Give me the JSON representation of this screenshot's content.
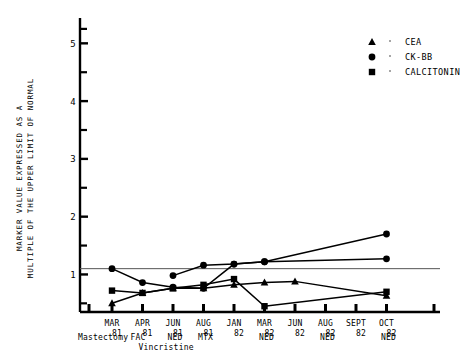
{
  "chart_data": {
    "type": "line",
    "title": "",
    "xlabel": "",
    "ylabel": "MARKER VALUE EXPRESSED AS A MULTIPLE OF THE UPPER LIMIT OF NORMAL",
    "ylabel_line1": "MARKER VALUE EXPRESSED AS A",
    "ylabel_line2": "MULTIPLE OF THE UPPER LIMIT OF NORMAL",
    "ylim": [
      0.35,
      5.3
    ],
    "yticks_major": [
      1,
      2,
      3,
      4,
      5
    ],
    "ytick_labels": [
      "1",
      "2",
      "3",
      "4",
      "5"
    ],
    "yticks_minor": [
      0.5,
      1.5,
      2.5,
      3.5,
      4.5,
      5.25
    ],
    "grid": false,
    "reference_line": {
      "value": 1.1,
      "label": ""
    },
    "legend_position": "top-right",
    "categories": [
      "MAR 81",
      "APR 81",
      "JUN 81",
      "AUG 81",
      "JAN 82",
      "MAR 82",
      "JUN 82",
      "AUG 82",
      "SEPT 82",
      "OCT 82"
    ],
    "category_months": [
      "MAR",
      "APR",
      "JUN",
      "AUG",
      "JAN",
      "MAR",
      "JUN",
      "AUG",
      "SEPT",
      "OCT"
    ],
    "category_years": [
      "81",
      "81",
      "81",
      "81",
      "82",
      "82",
      "82",
      "82",
      "82",
      "82"
    ],
    "series": [
      {
        "name": "CEA",
        "marker": "triangle",
        "x": [
          "MAR 81",
          "APR 81",
          "JUN 81",
          "AUG 81",
          "JAN 82",
          "MAR 82",
          "JUN 82",
          "OCT 82"
        ],
        "values": [
          0.5,
          0.68,
          0.76,
          0.76,
          0.82,
          0.86,
          0.88,
          0.63
        ]
      },
      {
        "name": "CK-BB",
        "marker": "circle",
        "x": [
          "MAR 81",
          "APR 81",
          "JUN 81",
          "AUG 81",
          "JAN 82",
          "MAR 82",
          "OCT 82"
        ],
        "values": [
          1.1,
          0.86,
          0.78,
          0.76,
          1.18,
          1.22,
          1.27
        ]
      },
      {
        "name": "CALCITONIN",
        "marker": "square",
        "x": [
          "MAR 81",
          "APR 81",
          "JUN 81",
          "AUG 81",
          "JAN 82",
          "MAR 82",
          "OCT 82"
        ],
        "values": [
          0.72,
          0.68,
          0.76,
          0.82,
          0.92,
          0.45,
          0.7
        ]
      },
      {
        "name": "CK-BB-upper",
        "marker": "circle",
        "x": [
          "JUN 81",
          "AUG 81",
          "JAN 82",
          "MAR 82",
          "OCT 82"
        ],
        "values": [
          0.98,
          1.16,
          1.18,
          1.22,
          1.7
        ]
      }
    ],
    "annotations": [
      {
        "text": "Mastectomy",
        "at": "before MAR 81"
      },
      {
        "text": "FAC",
        "at": "APR 81"
      },
      {
        "text": "Vincristine",
        "at": "APR 81"
      },
      {
        "text": "NED",
        "at": "JUN 81"
      },
      {
        "text": "MTX",
        "at": "AUG 81"
      },
      {
        "text": "NED",
        "at": "MAR 82"
      },
      {
        "text": "NED",
        "at": "AUG 82"
      },
      {
        "text": "NED",
        "at": "OCT 82"
      }
    ]
  },
  "legend": {
    "items": [
      {
        "label": "CEA",
        "marker": "triangle"
      },
      {
        "label": "CK-BB",
        "marker": "circle"
      },
      {
        "label": "CALCITONIN",
        "marker": "square"
      }
    ]
  },
  "colors": {
    "ink": "#000000",
    "background": "#ffffff",
    "reference_line": "#555555"
  }
}
